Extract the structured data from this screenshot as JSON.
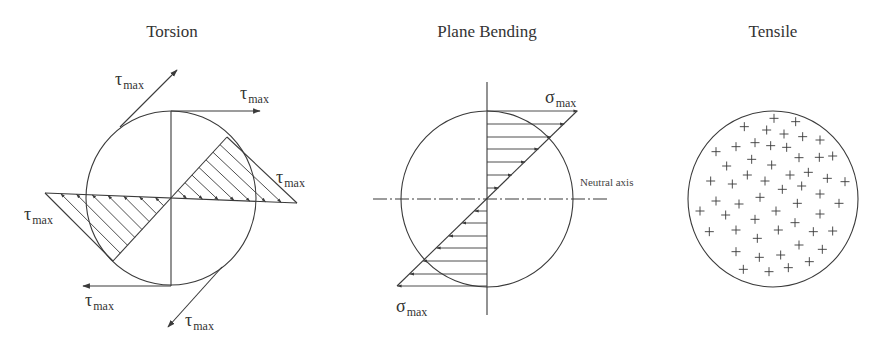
{
  "panels": [
    {
      "id": "torsion",
      "title": "Torsion",
      "labels": [
        {
          "symbol": "τ",
          "sub": "max",
          "x": 115,
          "y": 85
        },
        {
          "symbol": "τ",
          "sub": "max",
          "x": 240,
          "y": 99
        },
        {
          "symbol": "τ",
          "sub": "max",
          "x": 276,
          "y": 183
        },
        {
          "symbol": "τ",
          "sub": "max",
          "x": 24,
          "y": 220
        },
        {
          "symbol": "τ",
          "sub": "max",
          "x": 85,
          "y": 306
        },
        {
          "symbol": "τ",
          "sub": "max",
          "x": 185,
          "y": 326
        }
      ]
    },
    {
      "id": "plane-bending",
      "title": "Plane Bending",
      "labels": [
        {
          "symbol": "σ",
          "sub": "max",
          "x": 545,
          "y": 103
        },
        {
          "symbol": "σ",
          "sub": "max",
          "x": 396,
          "y": 312
        }
      ],
      "axis_label": "Neutral axis"
    },
    {
      "id": "tensile",
      "title": "Tensile",
      "marker": "+"
    }
  ],
  "colors": {
    "ink": "#3a3a3a",
    "background": "#ffffff"
  }
}
